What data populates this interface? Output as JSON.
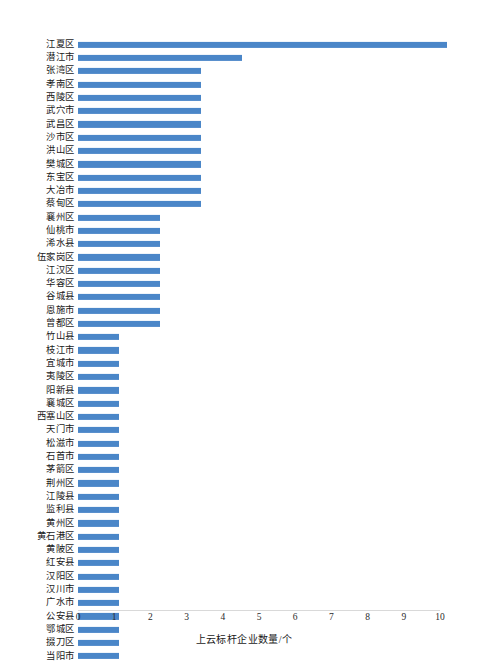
{
  "chart_data": {
    "type": "bar",
    "orientation": "horizontal",
    "title": "",
    "xlabel": "上云标杆企业数量/个",
    "ylabel": "",
    "xlim": [
      0,
      10
    ],
    "xticks": [
      "0",
      "1",
      "2",
      "3",
      "4",
      "5",
      "6",
      "7",
      "8",
      "9",
      "10"
    ],
    "grid": false,
    "legend": null,
    "bar_color": "#4a86c8",
    "categories": [
      "江夏区",
      "潜江市",
      "张湾区",
      "孝南区",
      "西陵区",
      "武穴市",
      "武昌区",
      "沙市区",
      "洪山区",
      "樊城区",
      "东宝区",
      "大冶市",
      "蔡甸区",
      "襄州区",
      "仙桃市",
      "浠水县",
      "伍家岗区",
      "江汉区",
      "华容区",
      "谷城县",
      "恩施市",
      "曾都区",
      "竹山县",
      "枝江市",
      "宜城市",
      "夷陵区",
      "阳新县",
      "襄城区",
      "西塞山区",
      "天门市",
      "松滋市",
      "石首市",
      "茅箭区",
      "荆州区",
      "江陵县",
      "监利县",
      "黄州区",
      "黄石港区",
      "黄陂区",
      "红安县",
      "汉阳区",
      "汉川市",
      "广水市",
      "公安县",
      "鄂城区",
      "掇刀区",
      "当阳市"
    ],
    "values": [
      9,
      4,
      3,
      3,
      3,
      3,
      3,
      3,
      3,
      3,
      3,
      3,
      3,
      2,
      2,
      2,
      2,
      2,
      2,
      2,
      2,
      2,
      1,
      1,
      1,
      1,
      1,
      1,
      1,
      1,
      1,
      1,
      1,
      1,
      1,
      1,
      1,
      1,
      1,
      1,
      1,
      1,
      1,
      1,
      1,
      1,
      1
    ]
  }
}
